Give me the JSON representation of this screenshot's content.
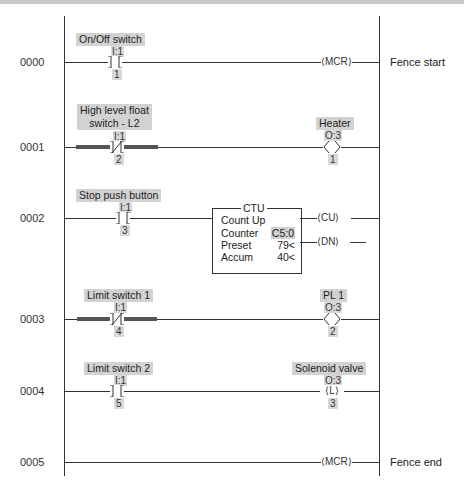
{
  "diagram": {
    "type": "ladder-logic",
    "rungs": [
      {
        "number": "0000",
        "contact": {
          "label": "On/Off switch",
          "address": "I:1",
          "bit": "1",
          "type": "XIC"
        },
        "output": {
          "type": "MCR",
          "label": "MCR"
        },
        "comment": "Fence start"
      },
      {
        "number": "0001",
        "contact": {
          "label_line1": "High level float",
          "label_line2": "switch - L2",
          "address": "I:1",
          "bit": "2",
          "type": "XIO",
          "highlighted": true
        },
        "output": {
          "type": "OTE",
          "label": "Heater",
          "address": "O:3",
          "bit": "1"
        }
      },
      {
        "number": "0002",
        "contact": {
          "label": "Stop push button",
          "address": "I:1",
          "bit": "3",
          "type": "XIC"
        },
        "block": {
          "title": "CTU",
          "name": "Count Up",
          "counter_label": "Counter",
          "counter_value": "C5:0",
          "preset_label": "Preset",
          "preset_value": "79<",
          "accum_label": "Accum",
          "accum_value": "40<"
        },
        "outputs": [
          {
            "label": "CU"
          },
          {
            "label": "DN"
          }
        ]
      },
      {
        "number": "0003",
        "contact": {
          "label": "Limit switch 1",
          "address": "I:1",
          "bit": "4",
          "type": "XIO",
          "highlighted": true
        },
        "output": {
          "type": "OTE",
          "label": "PL 1",
          "address": "O:3",
          "bit": "2"
        }
      },
      {
        "number": "0004",
        "contact": {
          "label": "Limit switch 2",
          "address": "I:1",
          "bit": "5",
          "type": "XIC"
        },
        "output": {
          "type": "OTL",
          "label": "Solenoid valve",
          "address": "O:3",
          "bit": "3",
          "coil_letter": "L"
        }
      },
      {
        "number": "0005",
        "output": {
          "type": "MCR",
          "label": "MCR"
        },
        "comment": "Fence end"
      }
    ]
  }
}
